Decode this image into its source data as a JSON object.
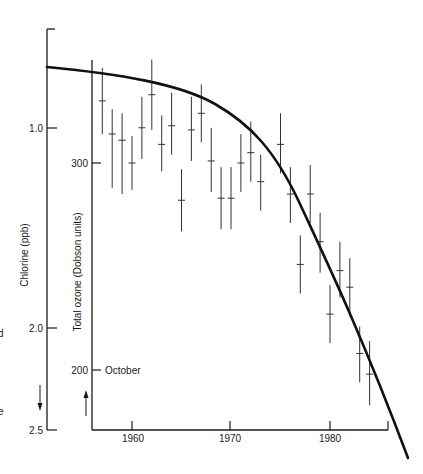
{
  "chart_data": {
    "type": "scatter",
    "title": "",
    "xlabel": "",
    "x_ticks": [
      1960,
      1970,
      1980
    ],
    "x_range": [
      1956,
      1986
    ],
    "axes": {
      "left": {
        "label": "Chlorine (ppb)",
        "ticks": [
          1.0,
          2.0,
          2.5
        ],
        "tick_labels": [
          "1.0",
          "2.0",
          "2.5"
        ],
        "range": [
          0.5,
          2.5
        ],
        "inverted": true,
        "arrow": "down"
      },
      "right_inner": {
        "label": "Total ozone (Dobson units)",
        "ticks": [
          300,
          200
        ],
        "tick_labels": [
          "300",
          "200"
        ],
        "range": [
          180,
          350
        ],
        "arrow": "up"
      }
    },
    "annotations": [
      {
        "text": "October",
        "at_ozone": 200
      }
    ],
    "series": [
      {
        "name": "Total ozone (October), with error bars",
        "axis": "right_inner",
        "style": "error-bar cross",
        "points": [
          {
            "x": 1957,
            "y": 330,
            "low": 314,
            "high": 346
          },
          {
            "x": 1958,
            "y": 314,
            "low": 288,
            "high": 326
          },
          {
            "x": 1959,
            "y": 311,
            "low": 285,
            "high": 324
          },
          {
            "x": 1960,
            "y": 300,
            "low": 287,
            "high": 313
          },
          {
            "x": 1961,
            "y": 317,
            "low": 302,
            "high": 332
          },
          {
            "x": 1962,
            "y": 333,
            "low": 316,
            "high": 350
          },
          {
            "x": 1963,
            "y": 309,
            "low": 296,
            "high": 323
          },
          {
            "x": 1964,
            "y": 318,
            "low": 304,
            "high": 334
          },
          {
            "x": 1965,
            "y": 282,
            "low": 267,
            "high": 297
          },
          {
            "x": 1966,
            "y": 316,
            "low": 301,
            "high": 332
          },
          {
            "x": 1967,
            "y": 324,
            "low": 310,
            "high": 338
          },
          {
            "x": 1968,
            "y": 301,
            "low": 286,
            "high": 317
          },
          {
            "x": 1969,
            "y": 283,
            "low": 268,
            "high": 298
          },
          {
            "x": 1970,
            "y": 283,
            "low": 268,
            "high": 298
          },
          {
            "x": 1971,
            "y": 300,
            "low": 286,
            "high": 314
          },
          {
            "x": 1972,
            "y": 305,
            "low": 291,
            "high": 320
          },
          {
            "x": 1973,
            "y": 291,
            "low": 277,
            "high": 304
          },
          {
            "x": 1975,
            "y": 309,
            "low": 295,
            "high": 324
          },
          {
            "x": 1976,
            "y": 285,
            "low": 271,
            "high": 298
          },
          {
            "x": 1977,
            "y": 251,
            "low": 237,
            "high": 265
          },
          {
            "x": 1978,
            "y": 285,
            "low": 271,
            "high": 299
          },
          {
            "x": 1979,
            "y": 262,
            "low": 247,
            "high": 276
          },
          {
            "x": 1980,
            "y": 227,
            "low": 213,
            "high": 241
          },
          {
            "x": 1981,
            "y": 248,
            "low": 235,
            "high": 262
          },
          {
            "x": 1982,
            "y": 240,
            "low": 226,
            "high": 254
          },
          {
            "x": 1983,
            "y": 208,
            "low": 194,
            "high": 221
          },
          {
            "x": 1984,
            "y": 198,
            "low": 183,
            "high": 214
          }
        ]
      },
      {
        "name": "Chlorine (model curve)",
        "axis": "left",
        "style": "thick line",
        "x": [
          1948,
          1955,
          1960,
          1965,
          1970,
          1975,
          1978,
          1980,
          1982,
          1984,
          1986,
          1988
        ],
        "values": [
          0.69,
          0.73,
          0.78,
          0.86,
          1.04,
          1.2,
          1.39,
          1.59,
          1.81,
          2.06,
          2.31,
          2.65
        ]
      }
    ],
    "grid": false,
    "legend": null
  },
  "page": {
    "clipped_left_text": [
      "d",
      "e"
    ]
  }
}
